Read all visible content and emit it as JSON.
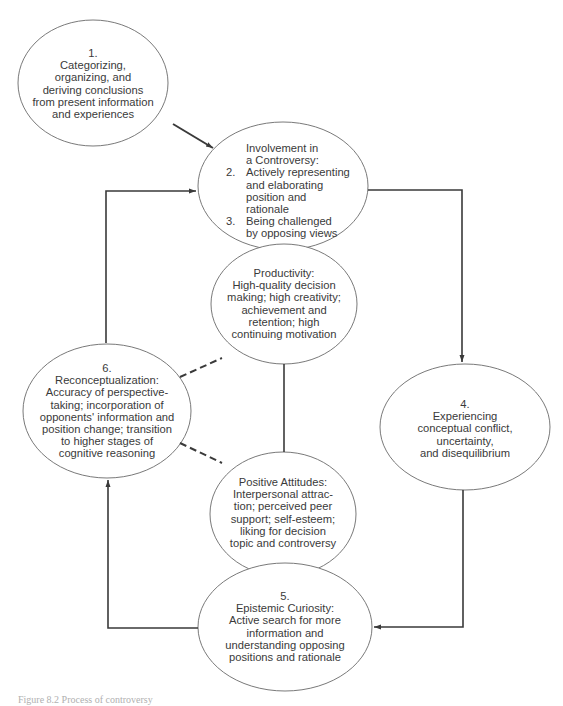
{
  "nodes": {
    "n1": {
      "lines": [
        "1.",
        "Categorizing,",
        "organizing, and",
        "deriving conclusions",
        "from present information",
        "and experiences"
      ]
    },
    "n23": {
      "heading": [
        "Involvement in",
        "a Controversy:"
      ],
      "items": [
        {
          "num": "2.",
          "lines": [
            "Actively representing",
            "and elaborating",
            "position and",
            "rationale"
          ]
        },
        {
          "num": "3.",
          "lines": [
            "Being challenged",
            "by opposing views"
          ]
        }
      ]
    },
    "productivity": {
      "lines": [
        "Productivity:",
        "High-quality decision",
        "making; high creativity;",
        "achievement and",
        "retention; high",
        "continuing motivation"
      ]
    },
    "n6": {
      "lines": [
        "6.",
        "Reconceptualization:",
        "Accuracy of perspective-",
        "taking; incorporation of",
        "opponents' information and",
        "position change; transition",
        "to higher stages of",
        "cognitive reasoning"
      ]
    },
    "attitudes": {
      "lines": [
        "Positive Attitudes:",
        "Interpersonal attrac-",
        "tion; perceived peer",
        "support; self-esteem;",
        "liking for decision",
        "topic and controversy"
      ]
    },
    "n4": {
      "lines": [
        "4.",
        "Experiencing",
        "conceptual conflict,",
        "uncertainty,",
        "and disequilibrium"
      ]
    },
    "n5": {
      "lines": [
        "5.",
        "Epistemic Curiosity:",
        "Active search for more",
        "information and",
        "understanding opposing",
        "positions and rationale"
      ]
    }
  },
  "caption": "Figure 8.2   Process of controversy",
  "colors": {
    "line": "#3a3a3a",
    "ellipse_stroke": "#6a6a6a",
    "text": "#3a3a3a",
    "background": "#ffffff"
  }
}
